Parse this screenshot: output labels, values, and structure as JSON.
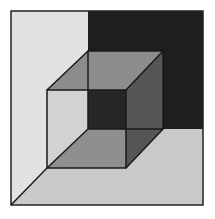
{
  "diagram": {
    "type": "3d-cube-in-room-corner",
    "frame": {
      "x": 11,
      "y": 11,
      "width": 192,
      "height": 194,
      "stroke": "#222222"
    },
    "colors": {
      "left_wall": "#e2e2e2",
      "back_wall": "#1e1e1e",
      "floor": "#c9c9c9",
      "cube_top": "#8c8c8c",
      "cube_left": "#d2d2d2",
      "cube_right": "#565656",
      "cube_bottom": "#8f8f8f",
      "cube_back": "#2e2e2e",
      "edge": "#1a1a1a"
    },
    "points": {
      "back_top_left": [
        88,
        51
      ],
      "back_top_right": [
        163,
        51
      ],
      "back_bottom_left": [
        88,
        129
      ],
      "back_bottom_right": [
        163,
        129
      ],
      "front_top_left": [
        47,
        90
      ],
      "front_top_right": [
        126,
        90
      ],
      "front_bottom_left": [
        47,
        168
      ],
      "front_bottom_right": [
        126,
        168
      ]
    }
  }
}
